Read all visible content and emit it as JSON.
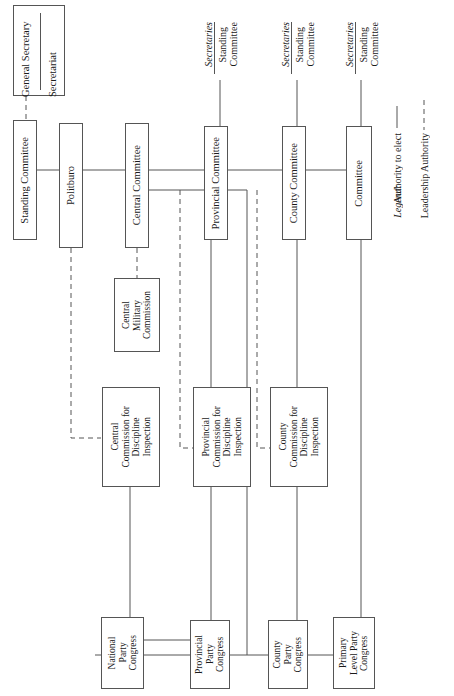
{
  "diagram": {
    "type": "organizational-chart",
    "orientation": "rotated-90-ccw",
    "line_color": "#555555",
    "background": "#ffffff"
  },
  "top_unit": {
    "general_secretary": "General Secretary",
    "secretariat": "Secretariat"
  },
  "central_row": [
    {
      "id": "standing-committee",
      "label": "Standing Committee"
    },
    {
      "id": "politburo",
      "label": "Politburo"
    },
    {
      "id": "central-committee",
      "label": "Central Committee"
    },
    {
      "id": "provincial-committee",
      "label": "Provincial Committee"
    },
    {
      "id": "county-committee",
      "label": "County Committee"
    },
    {
      "id": "primary-committee",
      "label": "Committee"
    }
  ],
  "secretary_groups": [
    {
      "id": "provincial-secretaries",
      "heading": "Secretaries",
      "sub": "Standing\nCommittee"
    },
    {
      "id": "county-secretaries",
      "heading": "Secretaries",
      "sub": "Standing\nCommittee"
    },
    {
      "id": "primary-secretaries",
      "heading": "Secretaries",
      "sub": "Standing\nCommittee"
    }
  ],
  "military": {
    "id": "central-military-commission",
    "label": "Central\nMilitary\nCommission"
  },
  "discipline_commissions": [
    {
      "id": "central-cdi",
      "label": "Central\nCommission for\nDiscipline\nInspection"
    },
    {
      "id": "provincial-cdi",
      "label": "Provincial\nCommission for\nDiscipline\nInspection"
    },
    {
      "id": "county-cdi",
      "label": "County\nCommission for\nDiscipline\nInspection"
    }
  ],
  "congresses": [
    {
      "id": "national-party-congress",
      "label": "National\nParty\nCongress"
    },
    {
      "id": "provincial-party-congress",
      "label": "Provincial\nParty\nCongress"
    },
    {
      "id": "county-party-congress",
      "label": "County\nParty\nCongress"
    },
    {
      "id": "primary-level-party-congress",
      "label": "Primary\nLevel Party\nCongress"
    }
  ],
  "legend": {
    "title": "Legend:",
    "entries": [
      {
        "id": "authority-to-elect",
        "style": "solid",
        "label": "Authority to elect"
      },
      {
        "id": "leadership-authority",
        "style": "dashed",
        "label": "Leadership Authority"
      }
    ]
  }
}
